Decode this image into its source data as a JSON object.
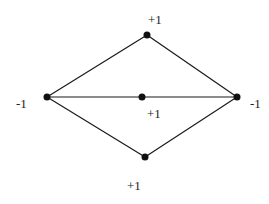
{
  "diagram": {
    "type": "graph",
    "nodes": [
      {
        "id": "top",
        "label": "+1",
        "x": 147,
        "y": 35,
        "lx": 155,
        "ly": 24
      },
      {
        "id": "left",
        "label": "-1",
        "x": 47,
        "y": 97,
        "lx": 20,
        "ly": 108
      },
      {
        "id": "center",
        "label": "+1",
        "x": 142,
        "y": 97,
        "lx": 154,
        "ly": 118
      },
      {
        "id": "right",
        "label": "-1",
        "x": 237,
        "y": 97,
        "lx": 255,
        "ly": 108
      },
      {
        "id": "bottom",
        "label": "+1",
        "x": 145,
        "y": 157,
        "lx": 135,
        "ly": 190
      }
    ],
    "edges": [
      [
        "left",
        "top"
      ],
      [
        "top",
        "right"
      ],
      [
        "left",
        "center"
      ],
      [
        "center",
        "right"
      ],
      [
        "left",
        "bottom"
      ],
      [
        "bottom",
        "right"
      ]
    ]
  },
  "labels": {
    "top": "+1",
    "left": "-1",
    "center": "+1",
    "right": "-1",
    "bottom": "+1"
  }
}
